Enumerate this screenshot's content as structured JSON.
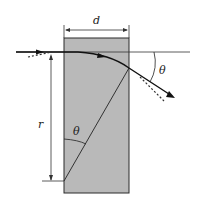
{
  "diagram": {
    "labels": {
      "width": "d",
      "radius": "r",
      "angle_inside": "θ",
      "angle_outside": "θ"
    },
    "colors": {
      "slab_fill": "#b8b8b8",
      "line": "#1a1a1a"
    }
  }
}
